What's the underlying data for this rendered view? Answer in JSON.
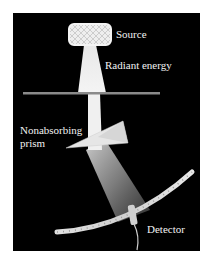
{
  "diagram": {
    "type": "prism-spectrometer-schematic",
    "background_color": "#000000",
    "labels": {
      "source": "Source",
      "radiant_energy": "Radiant energy",
      "prism_line1": "Nonabsorbing",
      "prism_line2": "prism",
      "detector": "Detector"
    },
    "components": [
      {
        "id": "source",
        "label": "Source"
      },
      {
        "id": "beam",
        "label": "Radiant energy"
      },
      {
        "id": "slit-plate",
        "label": ""
      },
      {
        "id": "prism",
        "label": "Nonabsorbing prism"
      },
      {
        "id": "dispersed-beam",
        "label": ""
      },
      {
        "id": "scale-arc",
        "label": ""
      },
      {
        "id": "detector",
        "label": "Detector"
      }
    ]
  }
}
